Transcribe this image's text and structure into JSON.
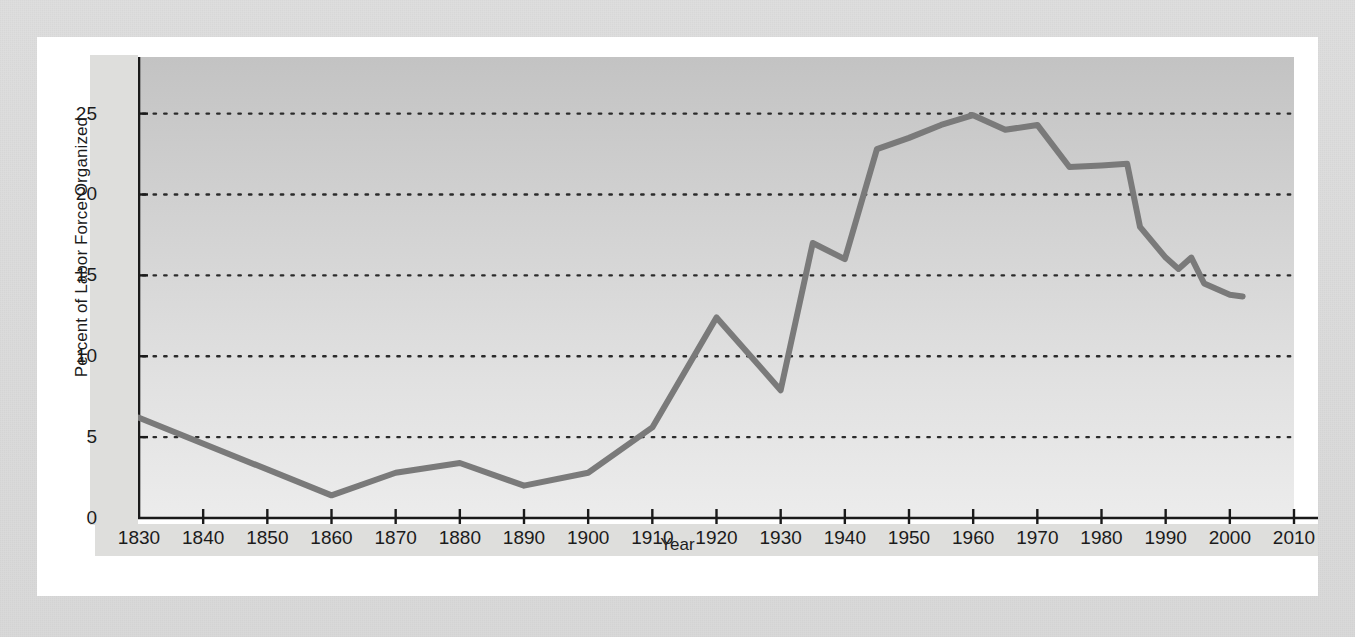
{
  "figure": {
    "background_outer": "#dcdcdc",
    "background_card": "#ffffff",
    "line_color": "#7a7a7a",
    "axis_color": "#1a1a1a",
    "grid_color": "#2b2b2b"
  },
  "chart_data": {
    "type": "line",
    "title": "",
    "xlabel": "Year",
    "ylabel": "Percent of Labor Force Organized",
    "xlim": [
      1830,
      2010
    ],
    "ylim": [
      0,
      28.5
    ],
    "xticks": [
      1830,
      1840,
      1850,
      1860,
      1870,
      1880,
      1890,
      1900,
      1910,
      1920,
      1930,
      1940,
      1950,
      1960,
      1970,
      1980,
      1990,
      2000,
      2010
    ],
    "xtick_labels": [
      "1830",
      "1840",
      "1850",
      "1860",
      "1870",
      "1880",
      "1890",
      "1900",
      "1910",
      "1920",
      "1930",
      "1940",
      "1950",
      "1960",
      "1970",
      "1980",
      "1990",
      "2000",
      "2010"
    ],
    "yticks": [
      0,
      5,
      10,
      15,
      20,
      25
    ],
    "ytick_labels": [
      "0",
      "5",
      "10",
      "15",
      "20",
      "25"
    ],
    "grid": "horizontal-dotted",
    "legend": "none",
    "series": [
      {
        "name": "Percent of Labor Force Organized",
        "color": "#7a7a7a",
        "x": [
          1830,
          1860,
          1870,
          1880,
          1890,
          1900,
          1910,
          1920,
          1930,
          1935,
          1940,
          1945,
          1950,
          1955,
          1960,
          1965,
          1970,
          1975,
          1980,
          1984,
          1986,
          1990,
          1992,
          1994,
          1996,
          2000,
          2002
        ],
        "y": [
          6.2,
          1.4,
          2.8,
          3.4,
          2.0,
          2.8,
          5.6,
          12.4,
          7.9,
          17.0,
          16.0,
          22.8,
          23.5,
          24.3,
          24.9,
          24.0,
          24.3,
          21.7,
          21.8,
          21.9,
          18.0,
          16.1,
          15.4,
          16.1,
          14.5,
          13.8,
          13.7
        ]
      }
    ]
  }
}
